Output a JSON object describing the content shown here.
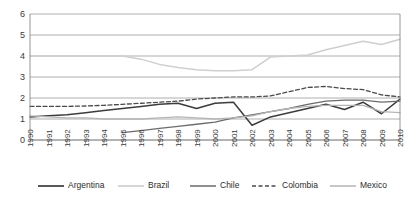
{
  "chart_data": {
    "type": "line",
    "title": "",
    "subtitle": "",
    "xlabel": "",
    "ylabel": "",
    "xlim": [
      1990,
      2010
    ],
    "ylim": [
      0,
      6
    ],
    "ytick_step": 1,
    "grid": true,
    "legend_position": "bottom",
    "x": [
      1990,
      1991,
      1992,
      1993,
      1994,
      1995,
      1996,
      1997,
      1998,
      1999,
      2000,
      2001,
      2002,
      2003,
      2004,
      2005,
      2006,
      2007,
      2008,
      2009,
      2010
    ],
    "xtick_labels": [
      "1990",
      "1991",
      "1992",
      "1993",
      "1994",
      "1995",
      "1996",
      "1997",
      "1998",
      "1999",
      "2000",
      "2001",
      "2002",
      "2003",
      "2004",
      "2005",
      "2006",
      "2007",
      "2008",
      "2009",
      "2010"
    ],
    "ytick_labels": [
      "0",
      "1",
      "2",
      "3",
      "4",
      "5",
      "6"
    ],
    "series": [
      {
        "name": "Argentina",
        "color": "#3c3c3c",
        "style": "solid",
        "width": 1.5,
        "values": [
          1.1,
          1.15,
          1.2,
          1.3,
          1.4,
          1.5,
          1.6,
          1.7,
          1.75,
          1.5,
          1.75,
          1.8,
          0.7,
          1.1,
          1.3,
          1.5,
          1.7,
          1.45,
          1.8,
          1.25,
          1.95
        ]
      },
      {
        "name": "Brazil",
        "color": "#cfcfcf",
        "style": "solid",
        "width": 1.5,
        "values": [
          4.0,
          4.0,
          4.0,
          4.0,
          4.0,
          4.0,
          3.85,
          3.6,
          3.45,
          3.35,
          3.3,
          3.3,
          3.35,
          3.95,
          4.0,
          4.05,
          4.3,
          4.5,
          4.7,
          4.55,
          4.8
        ]
      },
      {
        "name": "Chile",
        "color": "#6b6b6b",
        "style": "solid",
        "width": 1.3,
        "values": [
          null,
          null,
          null,
          null,
          null,
          0.35,
          0.45,
          0.55,
          0.65,
          0.75,
          0.85,
          1.05,
          1.2,
          1.35,
          1.5,
          1.7,
          1.85,
          1.9,
          1.9,
          1.8,
          1.85
        ]
      },
      {
        "name": "Colombia",
        "color": "#4a4a4a",
        "style": "dashed",
        "width": 1.3,
        "values": [
          1.6,
          1.6,
          1.6,
          1.62,
          1.65,
          1.7,
          1.75,
          1.8,
          1.85,
          1.95,
          2.0,
          2.05,
          2.05,
          2.1,
          2.3,
          2.5,
          2.55,
          2.45,
          2.4,
          2.15,
          2.05
        ]
      },
      {
        "name": "Mexico",
        "color": "#b5b5b5",
        "style": "solid",
        "width": 1.3,
        "values": [
          1.15,
          1.1,
          1.05,
          1.05,
          1.0,
          1.0,
          1.0,
          1.05,
          1.1,
          1.05,
          1.0,
          1.05,
          1.15,
          1.35,
          1.5,
          1.6,
          1.65,
          1.65,
          1.65,
          1.35,
          1.3
        ]
      }
    ]
  },
  "legend": {
    "items": [
      {
        "label": "Argentina"
      },
      {
        "label": "Brazil"
      },
      {
        "label": "Chile"
      },
      {
        "label": "Colombia"
      },
      {
        "label": "Mexico"
      }
    ]
  }
}
